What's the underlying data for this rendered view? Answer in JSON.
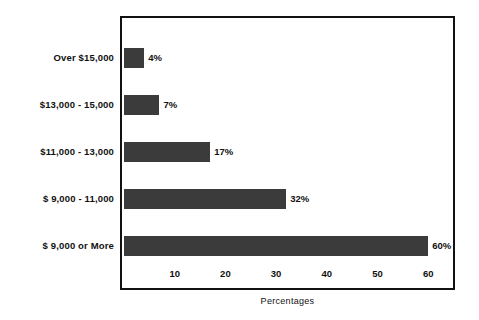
{
  "chart_data": {
    "type": "bar",
    "orientation": "horizontal",
    "title": "",
    "subtitle": "",
    "xlabel": "Percentages",
    "ylabel": "",
    "categories": [
      "Over $15,000",
      "$13,000 - 15,000",
      "$11,000 - 13,000",
      "$ 9,000 - 11,000",
      "$ 9,000 or More"
    ],
    "values": [
      4,
      7,
      17,
      32,
      60
    ],
    "data_labels": [
      "4%",
      "7%",
      "17%",
      "32%",
      "60%"
    ],
    "xlim": [
      0,
      65
    ],
    "xticks": [
      10,
      20,
      30,
      40,
      50,
      60
    ],
    "xtick_labels": [
      "10",
      "20",
      "30",
      "40",
      "50",
      "60"
    ],
    "grid": false,
    "legend": false,
    "bar_color": "#3b3b3b",
    "frame_color": "#111111",
    "background": "#ffffff"
  }
}
